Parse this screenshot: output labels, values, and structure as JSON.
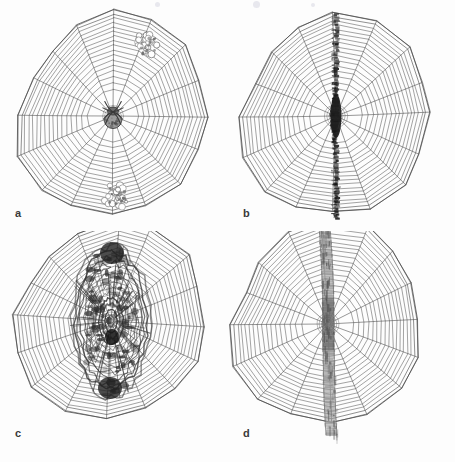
{
  "figure": {
    "kind": "scientific-plate",
    "background_color": "#ffffff",
    "ink_color": "#4a4a4a",
    "panel_rows": 2,
    "panel_cols": 2,
    "width_px": 455,
    "height_px": 462
  },
  "panels": [
    {
      "id": "a",
      "label": "a",
      "label_x": 15,
      "label_y": 208,
      "center_x": 113,
      "center_y": 116,
      "radius": 97,
      "radii_count": 16,
      "spiral_turns": 17,
      "decoration_type": "tufted-patches",
      "decoration_color": "#6e6e6e",
      "spider_present": true,
      "spider_x": 113,
      "spider_y": 119,
      "tufts": [
        {
          "x": 147,
          "y": 45,
          "r": 13
        },
        {
          "x": 116,
          "y": 196,
          "r": 13
        }
      ]
    },
    {
      "id": "b",
      "label": "b",
      "label_x": 243,
      "label_y": 208,
      "center_x": 108,
      "center_y": 116,
      "radius": 97,
      "radii_count": 16,
      "spiral_turns": 17,
      "decoration_type": "narrow-vertical-band",
      "decoration_color": "#2a2a2a",
      "band_width_px": 5,
      "band_hub_width_px": 11,
      "spider_present": false
    },
    {
      "id": "c",
      "label": "c",
      "label_x": 15,
      "label_y": 428,
      "center_x": 111,
      "center_y": 90,
      "radius": 97,
      "radii_count": 16,
      "spiral_turns": 17,
      "decoration_type": "dense-lenticular-mass",
      "decoration_color": "#3a3a3a",
      "mass_width_px": 78,
      "mass_height_px": 150,
      "spider_present": false
    },
    {
      "id": "d",
      "label": "d",
      "label_x": 243,
      "label_y": 428,
      "center_x": 100,
      "center_y": 93,
      "radius": 97,
      "radii_count": 16,
      "spiral_turns": 17,
      "decoration_type": "broad-silky-vertical-band",
      "decoration_color": "#9a9a9a",
      "band_width_px": 11,
      "spider_present": false
    }
  ],
  "chart_data": {
    "type": "table",
    "columns": [
      "panel",
      "decoration_type",
      "spider_at_hub"
    ],
    "rows": [
      [
        "a",
        "tufted-patches",
        "yes"
      ],
      [
        "b",
        "narrow-vertical-band",
        "no"
      ],
      [
        "c",
        "dense-lenticular-mass",
        "no"
      ],
      [
        "d",
        "broad-silky-vertical-band",
        "no"
      ]
    ]
  }
}
